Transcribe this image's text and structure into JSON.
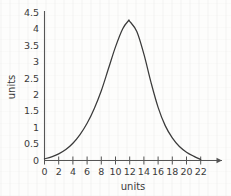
{
  "chart_data": {
    "type": "line",
    "title": "",
    "xlabel": "units",
    "ylabel": "units",
    "xlim": [
      0,
      22
    ],
    "ylim": [
      0,
      4.5
    ],
    "grid": false,
    "legend": null,
    "x_ticks": [
      0,
      2,
      4,
      6,
      8,
      10,
      12,
      14,
      16,
      18,
      20,
      22
    ],
    "x_tick_labels": [
      "0",
      "2",
      "4",
      "6",
      "8",
      "10",
      "12",
      "14",
      "16",
      "18",
      "20",
      "22"
    ],
    "y_ticks": [
      0,
      0.5,
      1,
      1.5,
      2,
      2.5,
      3,
      3.5,
      4,
      4.5
    ],
    "y_tick_labels": [
      "0",
      "0.5",
      "1",
      "1.5",
      "2",
      "2.5",
      "3",
      "3.5",
      "4",
      "4.5"
    ],
    "series": [
      {
        "name": "bell curve",
        "color": "#3a3a3a",
        "peak_x": 11.8,
        "peak_y": 4.2,
        "x": [
          0,
          1,
          2,
          3,
          4,
          5,
          6,
          7,
          8,
          9,
          10,
          11,
          11.8,
          12,
          13,
          14,
          15,
          16,
          17,
          18,
          19,
          20,
          21,
          22
        ],
        "values": [
          0.05,
          0.11,
          0.2,
          0.33,
          0.52,
          0.78,
          1.12,
          1.56,
          2.1,
          2.76,
          3.42,
          3.96,
          4.2,
          4.19,
          3.88,
          3.2,
          2.35,
          1.6,
          1.05,
          0.68,
          0.42,
          0.25,
          0.13,
          0.03
        ]
      }
    ]
  },
  "axes": {
    "x_title": "units",
    "y_title": "units"
  }
}
